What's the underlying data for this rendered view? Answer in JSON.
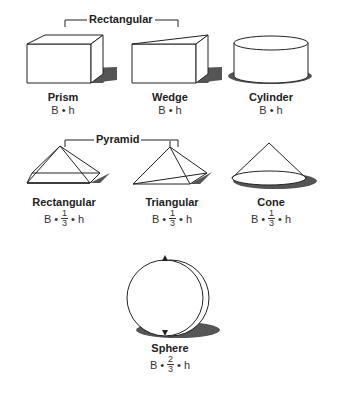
{
  "groups": [
    {
      "label": "Rectangular"
    },
    {
      "label": "Pyramid"
    }
  ],
  "shapes": [
    {
      "name": "Prism",
      "formula": {
        "prefix": "B",
        "dot1": "•",
        "frac": null,
        "suffix": "h"
      }
    },
    {
      "name": "Wedge",
      "formula": {
        "prefix": "B",
        "dot1": "•",
        "frac": null,
        "suffix": "h"
      }
    },
    {
      "name": "Cylinder",
      "formula": {
        "prefix": "B",
        "dot1": "•",
        "frac": null,
        "suffix": "h"
      }
    },
    {
      "name": "Rectangular",
      "formula": {
        "prefix": "B",
        "dot1": "•",
        "frac": {
          "num": "1",
          "den": "3"
        },
        "dot2": "•",
        "suffix": "h"
      }
    },
    {
      "name": "Triangular",
      "formula": {
        "prefix": "B",
        "dot1": "•",
        "frac": {
          "num": "1",
          "den": "3"
        },
        "dot2": "•",
        "suffix": "h"
      }
    },
    {
      "name": "Cone",
      "formula": {
        "prefix": "B",
        "dot1": "•",
        "frac": {
          "num": "1",
          "den": "3"
        },
        "dot2": "•",
        "suffix": "h"
      }
    },
    {
      "name": "Sphere",
      "formula": {
        "prefix": "B",
        "dot1": "•",
        "frac": {
          "num": "2",
          "den": "3"
        },
        "dot2": "•",
        "suffix": "h"
      }
    }
  ],
  "colors": {
    "line": "#222222",
    "shadow": "#555555",
    "fill": "#ffffff"
  }
}
